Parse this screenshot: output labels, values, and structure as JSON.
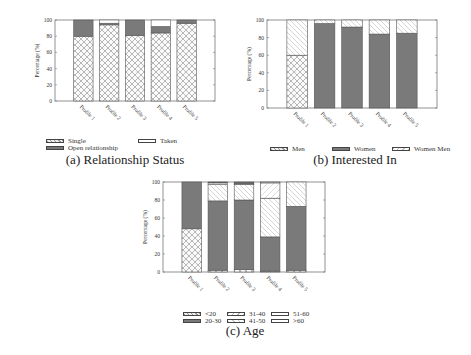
{
  "chart_data": [
    {
      "type": "bar",
      "stacked": true,
      "title": "(a) Relationship Status",
      "xlabel": "",
      "ylabel": "Percentage (%)",
      "ylim": [
        0,
        100
      ],
      "yticks": [
        0,
        20,
        40,
        60,
        80,
        100
      ],
      "categories": [
        "Profile 1",
        "Profile 2",
        "Profile 3",
        "Profile 4",
        "Profile 5"
      ],
      "series": [
        {
          "name": "Single",
          "pattern": "crosshatch",
          "values": [
            80,
            94,
            81,
            84,
            96
          ]
        },
        {
          "name": "Open relationship",
          "pattern": "dark",
          "values": [
            20,
            2,
            19,
            8,
            4
          ]
        },
        {
          "name": "Taken",
          "pattern": "blank",
          "values": [
            0,
            4,
            0,
            8,
            0
          ]
        }
      ],
      "legend_position": "bottom"
    },
    {
      "type": "bar",
      "stacked": true,
      "title": "(b) Interested In",
      "xlabel": "",
      "ylabel": "Percentage (%)",
      "ylim": [
        0,
        100
      ],
      "yticks": [
        0,
        20,
        40,
        60,
        80,
        100
      ],
      "categories": [
        "Profile 1",
        "Profile 2",
        "Profile 3",
        "Profile 4",
        "Profile 5"
      ],
      "series": [
        {
          "name": "Men",
          "pattern": "crosshatch",
          "values": [
            60,
            0,
            0,
            0,
            0
          ]
        },
        {
          "name": "Women",
          "pattern": "dark",
          "values": [
            0,
            96,
            92,
            84,
            85
          ]
        },
        {
          "name": "Women Men",
          "pattern": "diagonal",
          "values": [
            40,
            4,
            8,
            16,
            15
          ]
        }
      ],
      "legend_position": "bottom"
    },
    {
      "type": "bar",
      "stacked": true,
      "title": "(c) Age",
      "xlabel": "",
      "ylabel": "Percentage (%)",
      "ylim": [
        0,
        100
      ],
      "yticks": [
        0,
        20,
        40,
        60,
        80,
        100
      ],
      "categories": [
        "Profile 1",
        "Profile 2",
        "Profile 3",
        "Profile 4",
        "Profile 5"
      ],
      "series": [
        {
          "name": "<20",
          "pattern": "crosshatch",
          "values": [
            48,
            2,
            3,
            1,
            2
          ]
        },
        {
          "name": "20-30",
          "pattern": "dark",
          "values": [
            52,
            77,
            77,
            38,
            71
          ]
        },
        {
          "name": "31-40",
          "pattern": "diagonal",
          "values": [
            0,
            18,
            17,
            43,
            27
          ]
        },
        {
          "name": "41-50",
          "pattern": "diagonal-light",
          "values": [
            0,
            2,
            1,
            17,
            0
          ]
        },
        {
          "name": "51-60",
          "pattern": "blank",
          "values": [
            0,
            0,
            0,
            1,
            0
          ]
        },
        {
          "name": ">60",
          "pattern": "dark-thin",
          "values": [
            0,
            1,
            2,
            0,
            0
          ]
        }
      ],
      "legend_position": "bottom"
    }
  ],
  "captions": {
    "a": "(a) Relationship Status",
    "b": "(b) Interested In",
    "c": "(c) Age"
  },
  "legends": {
    "a": [
      "Single",
      "Open relationship",
      "Taken"
    ],
    "b": [
      "Men",
      "Women",
      "Women Men"
    ],
    "c": [
      "<20",
      "20-30",
      "31-40",
      "41-50",
      "51-60",
      ">60"
    ]
  },
  "axis": {
    "ylabel": "Percentage (%)",
    "yticks": [
      "0",
      "20",
      "40",
      "60",
      "80",
      "100"
    ]
  },
  "colors": {
    "dark": "#7a7a7a",
    "hatch": "#777777",
    "frame": "#555555"
  }
}
